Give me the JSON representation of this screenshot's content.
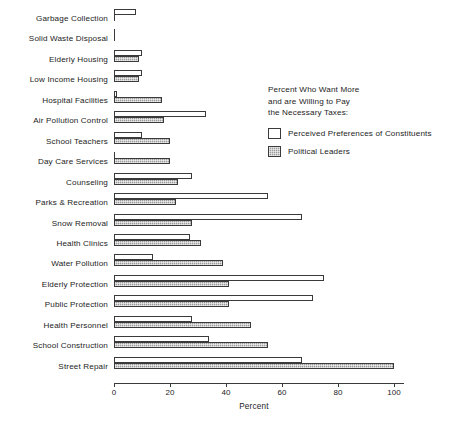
{
  "chart_data": {
    "type": "bar",
    "orientation": "horizontal",
    "title": "",
    "xlabel": "Percent",
    "ylabel": "",
    "xlim": [
      0,
      100
    ],
    "xticks": [
      0,
      20,
      40,
      60,
      80,
      100
    ],
    "grid": false,
    "legend_position": "upper right",
    "legend_title": [
      "Percent Who Want More",
      "and are Willing to Pay",
      "the Necessary Taxes:"
    ],
    "categories": [
      "Garbage Collection",
      "Solid Waste Disposal",
      "Elderly Housing",
      "Low Income Housing",
      "Hospital Facilities",
      "Air Pollution Control",
      "School Teachers",
      "Day Care Services",
      "Counseling",
      "Parks & Recreation",
      "Snow Removal",
      "Health Clinics",
      "Water Pollution",
      "Elderly Protection",
      "Public Protection",
      "Health Personnel",
      "School Construction",
      "Street Repair"
    ],
    "series": [
      {
        "name": "Perceived Preferences of Constituents",
        "fill": "white",
        "values": [
          8,
          0,
          10,
          10,
          1,
          33,
          10,
          0,
          28,
          55,
          67,
          27,
          14,
          75,
          71,
          28,
          34,
          67
        ]
      },
      {
        "name": "Political Leaders",
        "fill": "shaded",
        "values": [
          0,
          0,
          9,
          9,
          17,
          18,
          20,
          20,
          23,
          22,
          28,
          31,
          39,
          41,
          41,
          49,
          55,
          100
        ]
      }
    ]
  },
  "legend": {
    "entries": [
      {
        "label": "Perceived Preferences of Constituents",
        "swatch": "white"
      },
      {
        "label": "Political Leaders",
        "swatch": "shaded"
      }
    ]
  },
  "axis": {
    "tick_labels": [
      "0",
      "20",
      "40",
      "60",
      "80",
      "100"
    ],
    "title": "Percent"
  },
  "colors": {
    "bar_outline": "#3a3a3a",
    "bar_white_fill": "#ffffff",
    "bar_shaded_fill": "#9a9a9a",
    "text": "#1c1c1c",
    "background": "#ffffff"
  }
}
